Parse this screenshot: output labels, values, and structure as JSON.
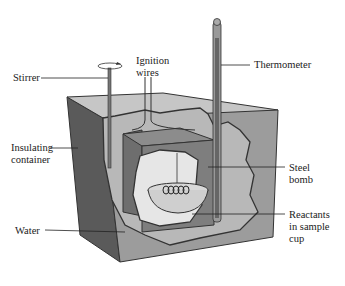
{
  "diagram": {
    "labels": {
      "stirrer": "Stirrer",
      "ignition_line1": "Ignition",
      "ignition_line2": "wires",
      "thermometer": "Thermometer",
      "insulating_line1": "Insulating",
      "insulating_line2": "container",
      "steel_line1": "Steel",
      "steel_line2": "bomb",
      "water": "Water",
      "reactants_line1": "Reactants",
      "reactants_line2": "in sample",
      "reactants_line3": "cup"
    },
    "colors": {
      "outer_front": "#9a9a9a",
      "outer_left": "#5a5a5a",
      "outer_top": "#c4c4c4",
      "water": "#b8b8b8",
      "bomb": "#7e7e7e",
      "bomb_top": "#8c8c8c",
      "interior": "#e8e8e8",
      "line": "#333333"
    }
  }
}
